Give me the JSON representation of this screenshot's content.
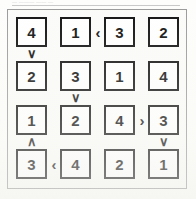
{
  "page": {
    "top_caption": "— ——— —— —",
    "background_color": "#fdfdfb",
    "frame_color": "#9a9a9a",
    "cell_border_color": "#111111",
    "digit_color": "#101010"
  },
  "puzzle": {
    "type": "futoshiki",
    "size": 4,
    "rows": [
      {
        "index": 1,
        "cells": [
          {
            "col": 1,
            "value": "4"
          },
          {
            "col": 2,
            "value": "1"
          },
          {
            "col": 3,
            "value": "3"
          },
          {
            "col": 4,
            "value": "2"
          }
        ]
      },
      {
        "index": 2,
        "cells": [
          {
            "col": 1,
            "value": "2"
          },
          {
            "col": 2,
            "value": "3"
          },
          {
            "col": 3,
            "value": "1"
          },
          {
            "col": 4,
            "value": "4"
          }
        ]
      },
      {
        "index": 3,
        "cells": [
          {
            "col": 1,
            "value": "1"
          },
          {
            "col": 2,
            "value": "2"
          },
          {
            "col": 3,
            "value": "4"
          },
          {
            "col": 4,
            "value": "3"
          }
        ]
      },
      {
        "index": 4,
        "cells": [
          {
            "col": 1,
            "value": "3"
          },
          {
            "col": 2,
            "value": "4"
          },
          {
            "col": 3,
            "value": "2"
          },
          {
            "col": 4,
            "value": "1"
          }
        ]
      }
    ],
    "horizontal_constraints": [
      {
        "row": 1,
        "between_cols": [
          2,
          3
        ],
        "glyph": "‹",
        "meaning": "less-than-pointing-left"
      },
      {
        "row": 3,
        "between_cols": [
          3,
          4
        ],
        "glyph": "›",
        "meaning": "greater-than-pointing-right"
      },
      {
        "row": 4,
        "between_cols": [
          1,
          2
        ],
        "glyph": "‹",
        "meaning": "less-than-pointing-left"
      }
    ],
    "vertical_constraints": [
      {
        "col": 1,
        "between_rows": [
          1,
          2
        ],
        "glyph": "∨",
        "meaning": "chevron-down"
      },
      {
        "col": 2,
        "between_rows": [
          2,
          3
        ],
        "glyph": "∨",
        "meaning": "chevron-down"
      },
      {
        "col": 1,
        "between_rows": [
          3,
          4
        ],
        "glyph": "∧",
        "meaning": "chevron-up"
      },
      {
        "col": 4,
        "between_rows": [
          3,
          4
        ],
        "glyph": "∨",
        "meaning": "chevron-down"
      }
    ]
  }
}
